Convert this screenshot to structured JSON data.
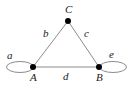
{
  "figure": {
    "type": "undirected-graph-with-self-loops",
    "background_color": "#ffffff",
    "edge_color": "#8c8c8c",
    "vertex_color": "#000000",
    "label_color": "#1a1a1a",
    "width": 135,
    "height": 90
  },
  "vertices": [
    {
      "id": "A",
      "label": "A",
      "x": 33,
      "y": 67,
      "radius": 3,
      "label_x": 30,
      "label_y": 72
    },
    {
      "id": "B",
      "label": "B",
      "x": 99,
      "y": 67,
      "radius": 3,
      "label_x": 96,
      "label_y": 72
    },
    {
      "id": "C",
      "label": "C",
      "x": 68,
      "y": 21,
      "radius": 3,
      "label_x": 65,
      "label_y": 4
    }
  ],
  "edges": [
    {
      "id": "b",
      "label": "b",
      "from": "A",
      "to": "C",
      "label_x": 43,
      "label_y": 28
    },
    {
      "id": "c",
      "label": "c",
      "from": "C",
      "to": "B",
      "label_x": 84,
      "label_y": 28
    },
    {
      "id": "d",
      "label": "d",
      "from": "A",
      "to": "B",
      "label_x": 63,
      "label_y": 71
    }
  ],
  "loops": [
    {
      "id": "a",
      "label": "a",
      "at": "A",
      "side": "left",
      "center_x": 20,
      "center_y": 67,
      "rx": 13.5,
      "ry": 5.5,
      "label_x": 7,
      "label_y": 50
    },
    {
      "id": "e",
      "label": "e",
      "at": "B",
      "side": "right",
      "center_x": 113,
      "center_y": 67,
      "rx": 13.5,
      "ry": 5.5,
      "label_x": 109,
      "label_y": 49
    }
  ]
}
